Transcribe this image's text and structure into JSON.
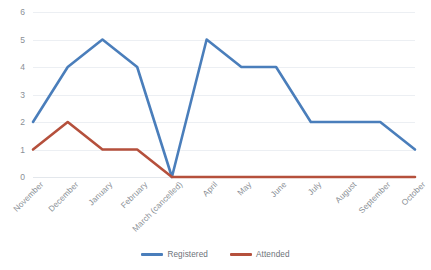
{
  "chart_data": {
    "type": "line",
    "title": "",
    "xlabel": "",
    "ylabel": "",
    "ylim": [
      0,
      6
    ],
    "yticks": [
      "0",
      "1",
      "2",
      "3",
      "4",
      "5",
      "6"
    ],
    "grid": true,
    "legend_position": "bottom-center",
    "categories": [
      "November",
      "December",
      "January",
      "February",
      "March (cancelled)",
      "April",
      "May",
      "June",
      "July",
      "August",
      "September",
      "October"
    ],
    "series": [
      {
        "name": "Registered",
        "color": "#4A7EBB",
        "values": [
          2,
          4,
          5,
          4,
          0,
          5,
          4,
          4,
          2,
          2,
          2,
          1
        ]
      },
      {
        "name": "Attended",
        "color": "#B5503C",
        "values": [
          1,
          2,
          1,
          1,
          0,
          0,
          0,
          0,
          0,
          0,
          0,
          0
        ]
      }
    ]
  },
  "legend": {
    "items": [
      {
        "label": "Registered",
        "color": "#4A7EBB"
      },
      {
        "label": "Attended",
        "color": "#B5503C"
      }
    ]
  },
  "colors": {
    "registered": "#4A7EBB",
    "attended": "#B5503C",
    "gridline": "#eceff3",
    "tick_text": "#8a8f96",
    "background": "#ffffff"
  }
}
